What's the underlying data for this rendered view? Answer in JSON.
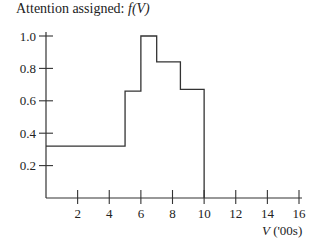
{
  "chart_data": {
    "type": "line",
    "subtype": "step",
    "title": "Attention assigned: f(V)",
    "title_parts": {
      "prefix": "Attention assigned: ",
      "func": "f(V)"
    },
    "xlabel": "V ('00s)",
    "xlabel_parts": {
      "var": "V",
      "unit": " ('00s)"
    },
    "ylabel": "",
    "xlim": [
      0,
      16
    ],
    "ylim": [
      0,
      1.0
    ],
    "x_ticks": [
      2,
      4,
      6,
      8,
      10,
      12,
      14,
      16
    ],
    "x_tick_labels": [
      "2",
      "4",
      "6",
      "8",
      "10",
      "12",
      "14",
      "16"
    ],
    "y_ticks": [
      0.2,
      0.4,
      0.6,
      0.8,
      1.0
    ],
    "y_tick_labels": [
      "0.2",
      "0.4",
      "0.6",
      "0.8",
      "1.0"
    ],
    "grid": false,
    "legend": null,
    "series": [
      {
        "name": "f(V)",
        "steps": [
          {
            "x_start": 0,
            "x_end": 5,
            "y": 0.32
          },
          {
            "x_start": 5,
            "x_end": 6,
            "y": 0.66
          },
          {
            "x_start": 6,
            "x_end": 7,
            "y": 1.0
          },
          {
            "x_start": 7,
            "x_end": 8.5,
            "y": 0.84
          },
          {
            "x_start": 8.5,
            "x_end": 10,
            "y": 0.67
          }
        ],
        "after_x": 10,
        "after_y": 0
      }
    ]
  },
  "colors": {
    "line": "#333333",
    "axis": "#333333",
    "background": "#ffffff"
  }
}
